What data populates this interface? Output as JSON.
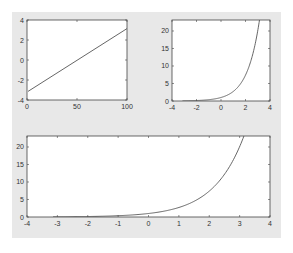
{
  "chart_data": [
    {
      "type": "line",
      "title": "",
      "xlabel": "",
      "ylabel": "",
      "position": "top-left",
      "series": [
        {
          "name": "x",
          "function": "linspace(-pi, pi, 100) vs index",
          "x": [
            1,
            100
          ],
          "values": [
            -3.1416,
            3.1416
          ]
        }
      ],
      "xlim": [
        0,
        100
      ],
      "ylim": [
        -4,
        4
      ],
      "xticks": [
        0,
        50,
        100
      ],
      "yticks": [
        -4,
        -2,
        0,
        2,
        4
      ],
      "grid": false,
      "legend": null
    },
    {
      "type": "line",
      "title": "",
      "xlabel": "",
      "ylabel": "",
      "position": "top-right",
      "series": [
        {
          "name": "exp(x)",
          "function": "exp(x)",
          "x_range": [
            -3.1416,
            3.1416
          ]
        }
      ],
      "xlim": [
        -4,
        4
      ],
      "ylim": [
        0,
        23.14
      ],
      "xticks": [
        -4,
        -2,
        0,
        2,
        4
      ],
      "yticks": [
        0,
        5,
        10,
        15,
        20
      ],
      "grid": false,
      "legend": null
    },
    {
      "type": "line",
      "title": "",
      "xlabel": "",
      "ylabel": "",
      "position": "bottom-wide",
      "series": [
        {
          "name": "exp(x)",
          "function": "exp(x)",
          "x_range": [
            -3.1416,
            3.1416
          ]
        }
      ],
      "xlim": [
        -4,
        4
      ],
      "ylim": [
        0,
        23.14
      ],
      "xticks": [
        -4,
        -3,
        -2,
        -1,
        0,
        1,
        2,
        3,
        4
      ],
      "yticks": [
        0,
        5,
        10,
        15,
        20
      ],
      "grid": false,
      "legend": null
    }
  ],
  "colors": {
    "figure_bg": "#e8e8e8",
    "axes_bg": "#ffffff",
    "line": "#555555",
    "axes_edge": "#444444"
  }
}
